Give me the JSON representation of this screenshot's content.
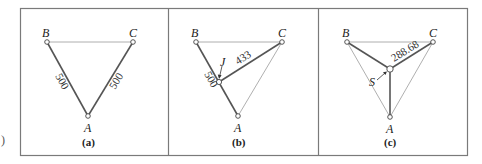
{
  "figure": {
    "left_fragment": ")",
    "colors": {
      "frame": "#7a7a7a",
      "thin_edge": "#9a9a9a",
      "thick_edge": "#555555",
      "node_fill": "#ffffff",
      "node_stroke": "#444444"
    },
    "panels": [
      {
        "id": "a",
        "caption": "(a)",
        "nodes": {
          "A": "A",
          "B": "B",
          "C": "C"
        },
        "edges": [
          {
            "from": "B",
            "to": "C",
            "weight": "thin"
          },
          {
            "from": "B",
            "to": "A",
            "weight": "thick",
            "label": "500"
          },
          {
            "from": "C",
            "to": "A",
            "weight": "thick",
            "label": "500"
          }
        ]
      },
      {
        "id": "b",
        "caption": "(b)",
        "nodes": {
          "A": "A",
          "B": "B",
          "C": "C",
          "J": "J"
        },
        "edges": [
          {
            "from": "B",
            "to": "C",
            "weight": "thin"
          },
          {
            "from": "C",
            "to": "A",
            "weight": "thin"
          },
          {
            "from": "B",
            "to": "A",
            "weight": "thick",
            "label": "500"
          },
          {
            "from": "J",
            "to": "C",
            "weight": "thick",
            "label": "433"
          }
        ]
      },
      {
        "id": "c",
        "caption": "(c)",
        "nodes": {
          "A": "A",
          "B": "B",
          "C": "C",
          "S": "S"
        },
        "edges": [
          {
            "from": "B",
            "to": "C",
            "weight": "thin"
          },
          {
            "from": "B",
            "to": "A",
            "weight": "thin"
          },
          {
            "from": "C",
            "to": "A",
            "weight": "thin"
          },
          {
            "from": "S",
            "to": "B",
            "weight": "thick"
          },
          {
            "from": "S",
            "to": "C",
            "weight": "thick",
            "label": "288.68"
          },
          {
            "from": "S",
            "to": "A",
            "weight": "thick"
          }
        ]
      }
    ]
  }
}
